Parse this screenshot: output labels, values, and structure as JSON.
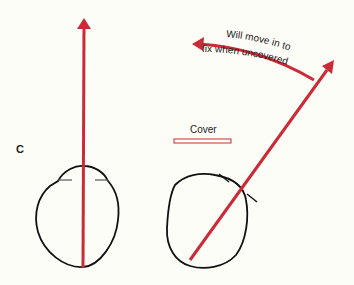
{
  "panel_label": "C",
  "cover_label": "Cover",
  "arc_text_line1": "Will move in to",
  "arc_text_line2": "fix when uncovered",
  "colors": {
    "arrow": "#cc2a36",
    "outline": "#111111",
    "background": "#fdfdf8"
  }
}
